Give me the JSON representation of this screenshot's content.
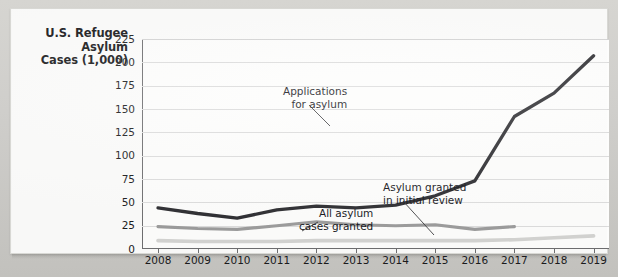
{
  "chart_title_lines": [
    "U.S. Refugee",
    "Asylum",
    "Cases (1,000)"
  ],
  "annotations": {
    "applications": [
      "Applications",
      "for asylum"
    ],
    "all_granted": [
      "All asylum",
      "cases granted"
    ],
    "initial_review": [
      "Asylum granted",
      "in initial review"
    ]
  },
  "colors": {
    "applications_line": "#2c2c30",
    "all_granted_line": "#9b9b9b",
    "initial_review_line": "#d4d4d2",
    "gridline": "#dcdcdc",
    "axis": "#6e6e70",
    "text": "#18181a",
    "card_background": "#fbfbfa",
    "page_background": "#c9c9c4"
  },
  "chart_data": {
    "type": "line",
    "title": "U.S. Refugee Asylum Cases (1,000)",
    "xlabel": "",
    "ylabel": "U.S. Refugee Asylum Cases (1,000)",
    "categories": [
      2008,
      2009,
      2010,
      2011,
      2012,
      2013,
      2014,
      2015,
      2016,
      2017,
      2018,
      2019
    ],
    "x_tick_labels": [
      "2008",
      "2009",
      "2010",
      "2011",
      "2012",
      "2013",
      "2014",
      "2015",
      "2016",
      "2017",
      "2018",
      "2019"
    ],
    "y_tick_labels": [
      "0",
      "25",
      "50",
      "75",
      "100",
      "125",
      "150",
      "175",
      "200",
      "225"
    ],
    "y_ticks": [
      0,
      25,
      50,
      75,
      100,
      125,
      150,
      175,
      200,
      225
    ],
    "ylim": [
      0,
      225
    ],
    "xlim": [
      2008,
      2019
    ],
    "grid": true,
    "legend": "annotations on plot",
    "series": [
      {
        "name": "Applications for asylum",
        "color": "#2c2c30",
        "values": [
          44,
          38,
          33,
          42,
          46,
          44,
          47,
          57,
          73,
          142,
          167,
          207
        ]
      },
      {
        "name": "All asylum cases granted",
        "color": "#9b9b9b",
        "values": [
          24,
          22,
          21,
          25,
          29,
          26,
          25,
          26,
          21,
          24,
          null,
          null
        ]
      },
      {
        "name": "Asylum granted in initial review",
        "color": "#d4d4d2",
        "values": [
          9,
          8,
          8,
          8,
          9,
          9,
          9,
          9,
          9,
          10,
          12,
          14
        ]
      }
    ]
  }
}
